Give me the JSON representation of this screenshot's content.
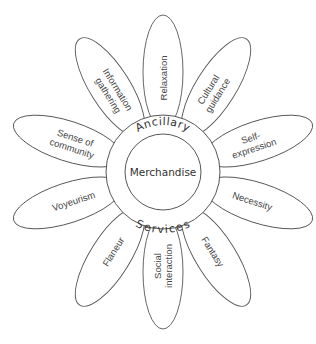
{
  "diagram": {
    "center_label": "Merchandise",
    "ring_top_label": "Ancillary",
    "ring_bottom_label": "Services",
    "petals": [
      {
        "label_lines": [
          "Relaxation"
        ],
        "angle": -90
      },
      {
        "label_lines": [
          "Cultural",
          "guidance"
        ],
        "angle": -58
      },
      {
        "label_lines": [
          "Self-",
          "expression"
        ],
        "angle": -18
      },
      {
        "label_lines": [
          "Necessity"
        ],
        "angle": 18
      },
      {
        "label_lines": [
          "Fantasy"
        ],
        "angle": 58
      },
      {
        "label_lines": [
          "Social",
          "interaction"
        ],
        "angle": 90
      },
      {
        "label_lines": [
          "Flaneur"
        ],
        "angle": 122
      },
      {
        "label_lines": [
          "Voyeurism"
        ],
        "angle": 162
      },
      {
        "label_lines": [
          "Sense of",
          "community"
        ],
        "angle": 198
      },
      {
        "label_lines": [
          "Information",
          "gathering"
        ],
        "angle": 238
      }
    ]
  }
}
